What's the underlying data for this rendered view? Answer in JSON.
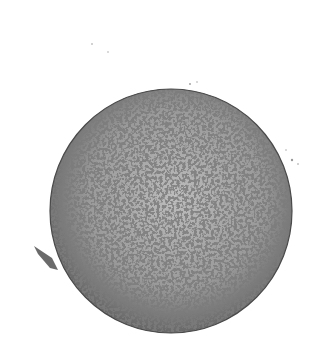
{
  "image": {
    "subject": "pencil sketch of a textured melon",
    "background_color": "#ffffff",
    "ink_color": "#3a3a3a",
    "mid_tone": "#8a8a8a",
    "highlight": "#e8e8e8"
  }
}
